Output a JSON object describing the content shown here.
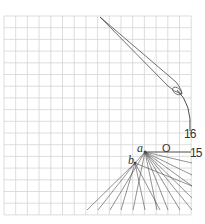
{
  "diagram": {
    "type": "geometric-construction-on-grid",
    "grid": {
      "x0": 4,
      "y0": 16,
      "cell": 11.7,
      "cols": 16,
      "rows": 17,
      "color": "#d4d4d4"
    },
    "stroke_color": "#4a4a4a",
    "labels": {
      "point_a": "a",
      "point_b": "b",
      "origin": "O",
      "mark_15": "15",
      "mark_16": "16"
    },
    "points": {
      "a": [
        145,
        152
      ],
      "b": [
        135,
        163
      ]
    },
    "needle": {
      "tip": [
        100,
        17
      ],
      "end": [
        182,
        94
      ],
      "eye_center": [
        177,
        91
      ]
    },
    "curve": {
      "from": [
        177,
        90
      ],
      "to": [
        190,
        131
      ]
    },
    "horizontal_line": {
      "from": [
        145,
        152
      ],
      "to": [
        191,
        152
      ]
    },
    "fan_from_a_right_endpoints_y": [
      163,
      175,
      186,
      198,
      210
    ],
    "fan_from_a_bottom_endpoints_x": [
      110,
      133,
      157,
      168,
      180
    ],
    "fan_from_b_bottom_endpoints_x": [
      87,
      98,
      121,
      145,
      160
    ]
  }
}
